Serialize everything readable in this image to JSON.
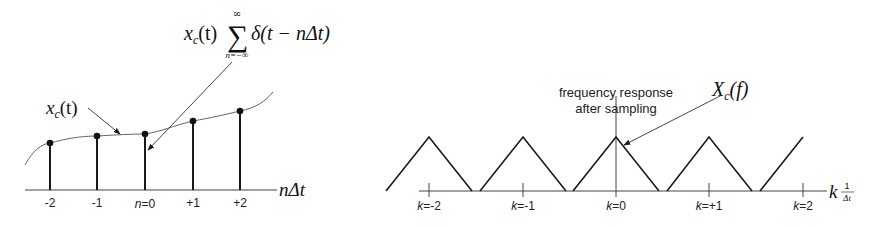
{
  "colors": {
    "stroke": "#1a1a1a",
    "thin": "#444444",
    "background": "#ffffff"
  },
  "left_panel": {
    "title_formula": {
      "prefix": "x",
      "prefix_sub": "c",
      "paren": "(t)",
      "sum_symbol": "∑",
      "sum_upper": "∞",
      "sum_lower": "n=−∞",
      "delta_term": "δ(t − nΔt)"
    },
    "signal_label": {
      "main": "x",
      "sub": "c",
      "arg": "(t)"
    },
    "axis_label": "nΔt",
    "tick_labels": [
      "-2",
      "-1",
      "n=0",
      "+1",
      "+2"
    ],
    "samples": [
      {
        "n": -2,
        "value": 0.47
      },
      {
        "n": -1,
        "value": 0.54
      },
      {
        "n": 0,
        "value": 0.56
      },
      {
        "n": 1,
        "value": 0.69
      },
      {
        "n": 2,
        "value": 0.79
      }
    ]
  },
  "right_panel": {
    "spectrum_label": {
      "main": "X",
      "sub": "c",
      "arg": "(f)"
    },
    "annotation_line1": "frequency response",
    "annotation_line2": "after sampling",
    "axis_label_k": "k",
    "axis_label_frac_num": "1",
    "axis_label_frac_den": "Δt",
    "tick_labels": [
      {
        "prefix": "k",
        "rest": "=-2"
      },
      {
        "prefix": "k",
        "rest": "=-1"
      },
      {
        "prefix": "k",
        "rest": "=0"
      },
      {
        "prefix": "k",
        "rest": "=+1"
      },
      {
        "prefix": "k",
        "rest": "=2"
      }
    ],
    "replica_centers_k": [
      -2,
      -1,
      0,
      1,
      2
    ]
  }
}
